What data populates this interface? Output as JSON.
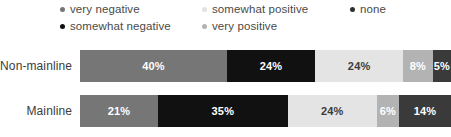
{
  "chart_data": {
    "type": "bar",
    "orientation": "horizontal",
    "stacked": true,
    "normalized": "percent",
    "title": "",
    "xlabel": "",
    "ylabel": "",
    "xlim": [
      0,
      100
    ],
    "grid": false,
    "legend_position": "top",
    "categories": [
      "Non-mainline",
      "Mainline"
    ],
    "series": [
      {
        "name": "very negative",
        "values": [
          40,
          21
        ]
      },
      {
        "name": "somewhat negative",
        "values": [
          24,
          35
        ]
      },
      {
        "name": "somewhat positive",
        "values": [
          24,
          24
        ]
      },
      {
        "name": "very positive",
        "values": [
          8,
          6
        ]
      },
      {
        "name": "none",
        "values": [
          5,
          14
        ]
      }
    ],
    "value_labels": {
      "Non-mainline": [
        "40%",
        "24%",
        "24%",
        "8%",
        "5%"
      ],
      "Mainline": [
        "21%",
        "35%",
        "24%",
        "6%",
        "14%"
      ]
    }
  },
  "legend": {
    "items": [
      {
        "label": "very negative",
        "color": "#767676",
        "marker": "legend-dot-very-negative"
      },
      {
        "label": "somewhat negative",
        "color": "#111111",
        "marker": "legend-dot-somewhat-negative"
      },
      {
        "label": "somewhat positive",
        "color": "#e2e2e2",
        "marker": "legend-dot-somewhat-positive"
      },
      {
        "label": "very positive",
        "color": "#b3b3b3",
        "marker": "legend-dot-very-positive"
      },
      {
        "label": "none",
        "color": "#2f2f2f",
        "marker": "legend-dot-none"
      }
    ]
  },
  "rows": [
    {
      "label": "Non-mainline",
      "segments": [
        {
          "name": "very negative",
          "value": "40%",
          "pct": 40,
          "color": "#767676",
          "text_color": "#ffffff"
        },
        {
          "name": "somewhat negative",
          "value": "24%",
          "pct": 24,
          "color": "#111111",
          "text_color": "#ffffff"
        },
        {
          "name": "somewhat positive",
          "value": "24%",
          "pct": 24,
          "color": "#e4e4e4",
          "text_color": "#3c3c3c"
        },
        {
          "name": "very positive",
          "value": "8%",
          "pct": 8,
          "color": "#b3b3b3",
          "text_color": "#ffffff"
        },
        {
          "name": "none",
          "value": "5%",
          "pct": 5,
          "color": "#3a3a3a",
          "text_color": "#ffffff"
        }
      ]
    },
    {
      "label": "Mainline",
      "segments": [
        {
          "name": "very negative",
          "value": "21%",
          "pct": 21,
          "color": "#767676",
          "text_color": "#ffffff"
        },
        {
          "name": "somewhat negative",
          "value": "35%",
          "pct": 35,
          "color": "#111111",
          "text_color": "#ffffff"
        },
        {
          "name": "somewhat positive",
          "value": "24%",
          "pct": 24,
          "color": "#e4e4e4",
          "text_color": "#3c3c3c"
        },
        {
          "name": "very positive",
          "value": "6%",
          "pct": 6,
          "color": "#b3b3b3",
          "text_color": "#ffffff"
        },
        {
          "name": "none",
          "value": "14%",
          "pct": 14,
          "color": "#3a3a3a",
          "text_color": "#ffffff"
        }
      ]
    }
  ]
}
